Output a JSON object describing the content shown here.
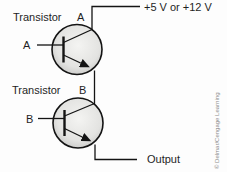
{
  "diagram": {
    "type": "circuit-schematic",
    "transistors": [
      {
        "name_label": "Transistor",
        "id_label": "A",
        "input_label": "A"
      },
      {
        "name_label": "Transistor",
        "id_label": "B",
        "input_label": "B"
      }
    ],
    "supply_label": "+5 V or +12 V",
    "output_label": "Output",
    "credit": "© Delmar/Cengage Learning",
    "colors": {
      "background": "#fdfdfd",
      "wire": "#141414",
      "text": "#1f1f1f",
      "transistor_fill_light": "#f4f4f2",
      "transistor_fill_dark": "#c9c9c7",
      "credit_text": "#8c8c8c"
    }
  }
}
